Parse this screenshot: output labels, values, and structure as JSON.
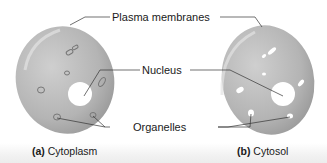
{
  "labels": {
    "plasma_membranes": "Plasma membranes",
    "nucleus": "Nucleus",
    "organelles": "Organelles"
  },
  "captions": {
    "a_letter": "(a)",
    "a_text": "Cytoplasm",
    "b_letter": "(b)",
    "b_text": "Cytosol"
  },
  "colors": {
    "cell_fill": "#b5b5b5",
    "cell_highlight": "#d4d4d4",
    "nucleus_fill": "#ffffff",
    "leader_line": "#333333"
  }
}
